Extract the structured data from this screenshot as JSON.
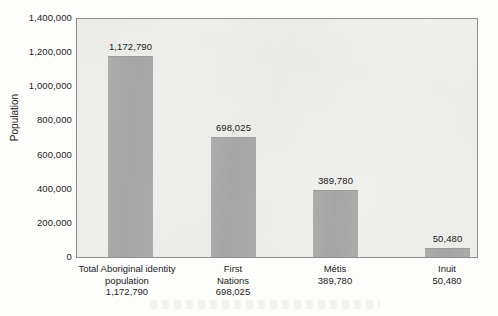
{
  "chart_data": {
    "type": "bar",
    "title": "",
    "xlabel": "",
    "ylabel": "Population",
    "categories": [
      "Total Aboriginal identity population",
      "First Nations",
      "Métis",
      "Inuit"
    ],
    "values": [
      1172790,
      698025,
      389780,
      50480
    ],
    "value_labels": [
      "1,172,790",
      "698,025",
      "389,780",
      "50,480"
    ],
    "ylim": [
      0,
      1400000
    ],
    "ytick_values": [
      1400000,
      1200000,
      1000000,
      800000,
      600000,
      400000,
      200000,
      0
    ],
    "ytick_labels": [
      "1,400,000",
      "1,200,000",
      "1,000,000",
      "800,000",
      "600,000",
      "400,000",
      "200,000",
      "0"
    ],
    "grid": false,
    "legend": false,
    "bar_color": "#a8a8a8",
    "plot_background": "#efefec",
    "text_color": "#1b1b1b",
    "axis_color": "#8e8e8e",
    "x_tick_labels": [
      {
        "lines": [
          "Total Aboriginal identity",
          "population",
          "1,172,790"
        ]
      },
      {
        "lines": [
          "First",
          "Nations",
          "698,025"
        ]
      },
      {
        "lines": [
          "Métis",
          "389,780"
        ]
      },
      {
        "lines": [
          "Inuit",
          "50,480"
        ]
      }
    ]
  }
}
